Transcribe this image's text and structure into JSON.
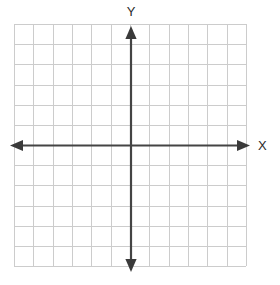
{
  "figure": {
    "name": "cartesian-coordinate-plane",
    "width": 280,
    "height": 285,
    "background_color": "#ffffff"
  },
  "chart_data": {
    "type": "scatter",
    "title": "",
    "subtitle": "",
    "xlabel": "X",
    "ylabel": "Y",
    "x": [],
    "y": [],
    "series": [],
    "annotations": [],
    "legend": {
      "entries": [],
      "position": "none",
      "visible": false
    },
    "grid": {
      "visible": true,
      "color": "#cccccc",
      "line_width": 1,
      "columns": 12,
      "rows": 12,
      "cell_size_px": 19.33,
      "left_px": 14,
      "top_px": 24,
      "right_px": 246,
      "bottom_px": 266
    },
    "axes": {
      "color": "#444444",
      "line_width": 2.2,
      "arrows": "both-ends",
      "x_axis": {
        "y_px": 145.5,
        "start_px": 10,
        "end_px": 250,
        "range": [
          -6,
          6
        ],
        "ticks": [],
        "tick_labels": [],
        "labels_visible": false
      },
      "y_axis": {
        "x_px": 131,
        "start_px": 272,
        "end_px": 26,
        "range": [
          -6,
          6
        ],
        "ticks": [],
        "tick_labels": [],
        "labels_visible": false
      },
      "origin_px": [
        131,
        145.5
      ]
    },
    "xlim": [
      -6,
      6
    ],
    "ylim": [
      -6,
      6
    ]
  },
  "labels": {
    "x_axis_label": "X",
    "y_axis_label": "Y"
  }
}
